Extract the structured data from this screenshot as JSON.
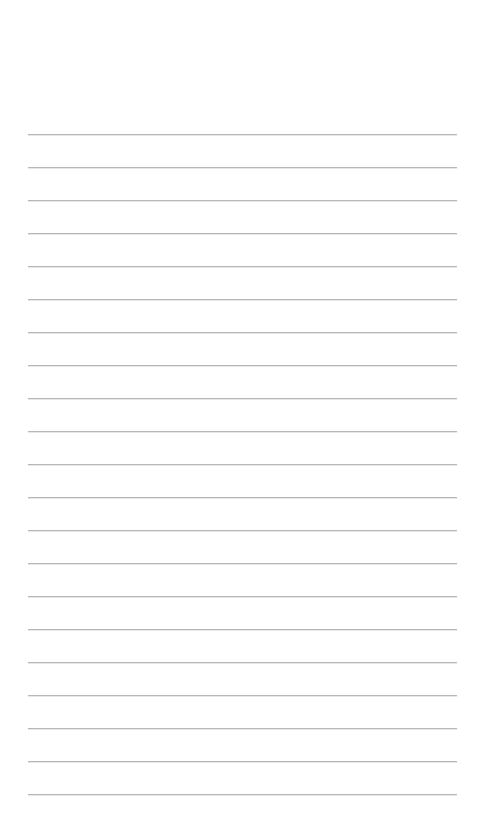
{
  "document": {
    "kind": "lined-notepaper",
    "title": "",
    "body_text": "",
    "background_color": "#ffffff",
    "page_width": 481,
    "page_height": 830
  },
  "rules": {
    "count": 21,
    "color": "#a9acb0",
    "thickness_px": 1,
    "left_x": 28,
    "right_x": 457,
    "first_y": 134,
    "spacing_y": 33,
    "y_positions": [
      134,
      167,
      200,
      233,
      266,
      299,
      332,
      365,
      398,
      431,
      464,
      497,
      530,
      563,
      596,
      629,
      662,
      695,
      728,
      761,
      794
    ]
  },
  "margins": {
    "top_blank_height": 134,
    "bottom_blank_height": 36,
    "left_margin": 28,
    "right_margin": 24
  }
}
